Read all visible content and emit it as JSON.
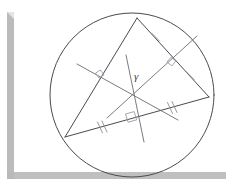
{
  "figure": {
    "center_label": "γ",
    "colors": {
      "ink": "#4a4a52",
      "mark": "#8d8d95",
      "right_angle": "#9a9aa2",
      "frame": "#b8b8b8",
      "background": "#ffffff"
    },
    "circle": {
      "cx": 132,
      "cy": 95,
      "r": 82
    },
    "triangle": {
      "vertices": [
        {
          "name": "top",
          "x": 137,
          "y": 18
        },
        {
          "name": "left",
          "x": 65,
          "y": 137
        },
        {
          "name": "right",
          "x": 209,
          "y": 97
        }
      ],
      "sides": [
        {
          "name": "top-left-side",
          "from": "top",
          "to": "left",
          "ticks": 0
        },
        {
          "name": "top-right-side",
          "from": "top",
          "to": "right",
          "ticks": 1
        },
        {
          "name": "bottom-side",
          "from": "left",
          "to": "right",
          "ticks": 2
        }
      ]
    },
    "circumcenter": {
      "x": 132,
      "y": 95
    },
    "bisectors": [
      {
        "name": "bisector-of-top-left-side",
        "midpoint_x": 101,
        "midpoint_y": 77.5
      },
      {
        "name": "bisector-of-top-right-side",
        "midpoint_x": 173,
        "midpoint_y": 57.5
      },
      {
        "name": "bisector-of-bottom-side",
        "midpoint_x": 137,
        "midpoint_y": 117
      }
    ],
    "right_angle_marks": 3,
    "tick_marks": {
      "top_right_side_per_half": 1,
      "bottom_side_per_half": 2
    }
  },
  "frame": {
    "left_bar_label": "left-border-bar",
    "bottom_bar_label": "bottom-border-bar"
  }
}
